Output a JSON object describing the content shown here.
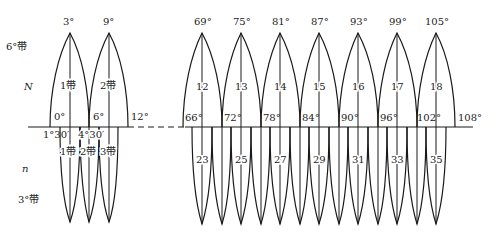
{
  "diagram": {
    "type": "map-projection-zones",
    "side_labels": {
      "six_deg_zone": "6°带",
      "north": "N",
      "six_deg_zone_number": "n",
      "three_deg_zone": "3°带"
    },
    "upper_left": {
      "apex_labels": [
        "3°",
        "9°"
      ],
      "zone_labels": [
        "1带",
        "2带"
      ],
      "edge_labels": [
        "0°",
        "6°",
        "12°"
      ]
    },
    "upper_right": {
      "apex_labels": [
        "69°",
        "75°",
        "81°",
        "87°",
        "93°",
        "99°",
        "105°"
      ],
      "zone_labels": [
        "12",
        "13",
        "14",
        "15",
        "16",
        "17",
        "18"
      ],
      "edge_labels": [
        "66°",
        "72°",
        "78°",
        "84°",
        "90°",
        "96°",
        "102°",
        "108°"
      ]
    },
    "lower_left": {
      "edge_labels": [
        "1°30′",
        "4°30′"
      ],
      "zone_labels": [
        "1带",
        "2带",
        "3带"
      ]
    },
    "lower_right": {
      "zone_labels": [
        "23",
        "25",
        "27",
        "29",
        "31",
        "33",
        "35"
      ]
    },
    "colors": {
      "line": "#1a1a1a",
      "background": "#ffffff"
    }
  }
}
